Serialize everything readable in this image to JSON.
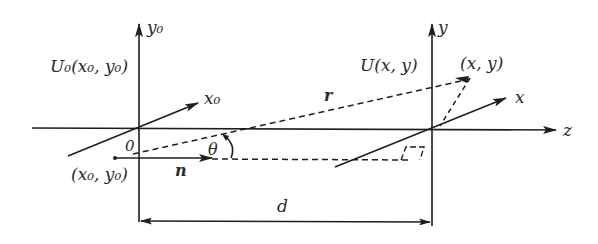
{
  "diagram": {
    "title": "",
    "source_plane": {
      "field_label": "U₀(x₀, y₀)",
      "axis_x_label": "x₀",
      "axis_y_label": "y₀",
      "origin_label": "0",
      "point_label": "(x₀, y₀)"
    },
    "observation_plane": {
      "field_label": "U(x, y)",
      "axis_x_label": "x",
      "axis_y_label": "y",
      "point_label": "(x, y)"
    },
    "propagation_axis_label": "z",
    "vector_r_label": "r",
    "normal_label": "n",
    "angle_label": "θ",
    "distance_label": "d"
  },
  "colors": {
    "line": "#1e1e1e",
    "text": "#2a2a2a",
    "background": "#ffffff"
  }
}
